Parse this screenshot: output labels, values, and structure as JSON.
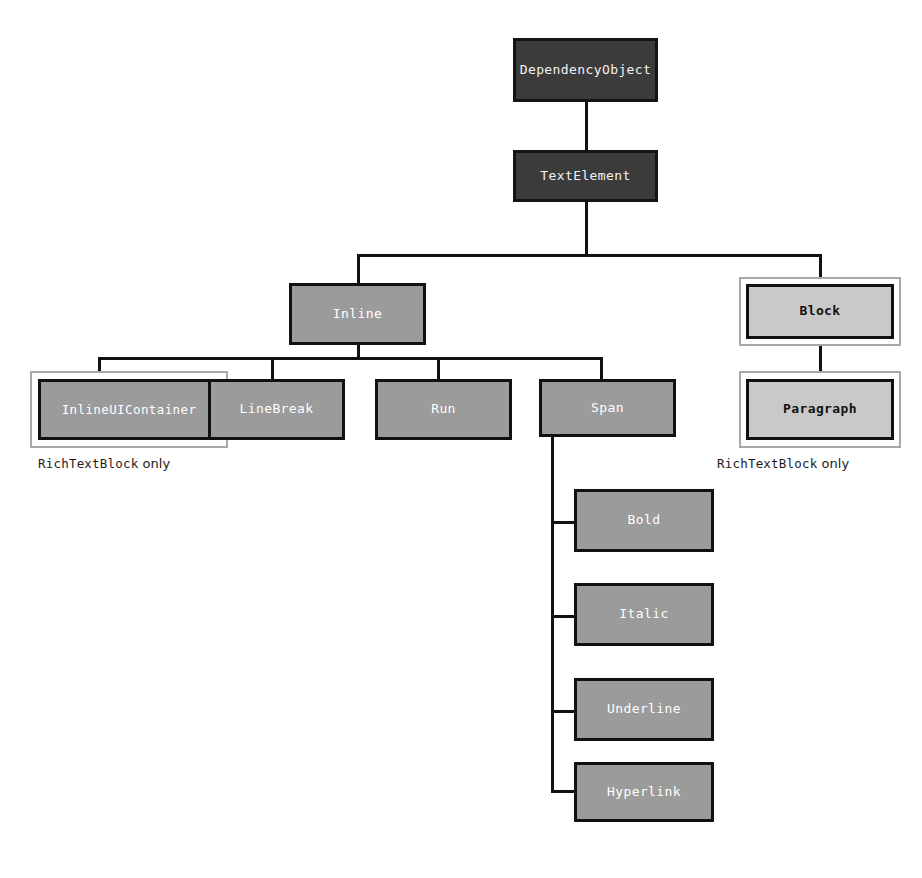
{
  "diagram": {
    "type": "class-hierarchy-tree",
    "colors": {
      "root_fill": "#3b3b3b",
      "root_text": "#f2f2f2",
      "mid_fill": "#9b9b9b",
      "mid_text": "#ffffff",
      "light_fill": "#c9c9c9",
      "light_text": "#121212",
      "border": "#111111",
      "outer_frame": "#a8a8a8",
      "background": "#ffffff"
    },
    "nodes": {
      "dependency_object": "DependencyObject",
      "text_element": "TextElement",
      "inline": "Inline",
      "block": "Block",
      "inline_ui_container": "InlineUIContainer",
      "line_break": "LineBreak",
      "run": "Run",
      "span": "Span",
      "paragraph": "Paragraph",
      "bold": "Bold",
      "italic": "Italic",
      "underline": "Underline",
      "hyperlink": "Hyperlink"
    },
    "captions": {
      "left_note_name": "RichTextBlock",
      "left_note_suffix": "only",
      "right_note_name": "RichTextBlock",
      "right_note_suffix": "only"
    },
    "edges": [
      {
        "from": "DependencyObject",
        "to": "TextElement"
      },
      {
        "from": "TextElement",
        "to": "Inline"
      },
      {
        "from": "TextElement",
        "to": "Block"
      },
      {
        "from": "Inline",
        "to": "InlineUIContainer"
      },
      {
        "from": "Inline",
        "to": "LineBreak"
      },
      {
        "from": "Inline",
        "to": "Run"
      },
      {
        "from": "Inline",
        "to": "Span"
      },
      {
        "from": "Block",
        "to": "Paragraph"
      },
      {
        "from": "Span",
        "to": "Bold"
      },
      {
        "from": "Span",
        "to": "Italic"
      },
      {
        "from": "Span",
        "to": "Underline"
      },
      {
        "from": "Span",
        "to": "Hyperlink"
      }
    ]
  }
}
